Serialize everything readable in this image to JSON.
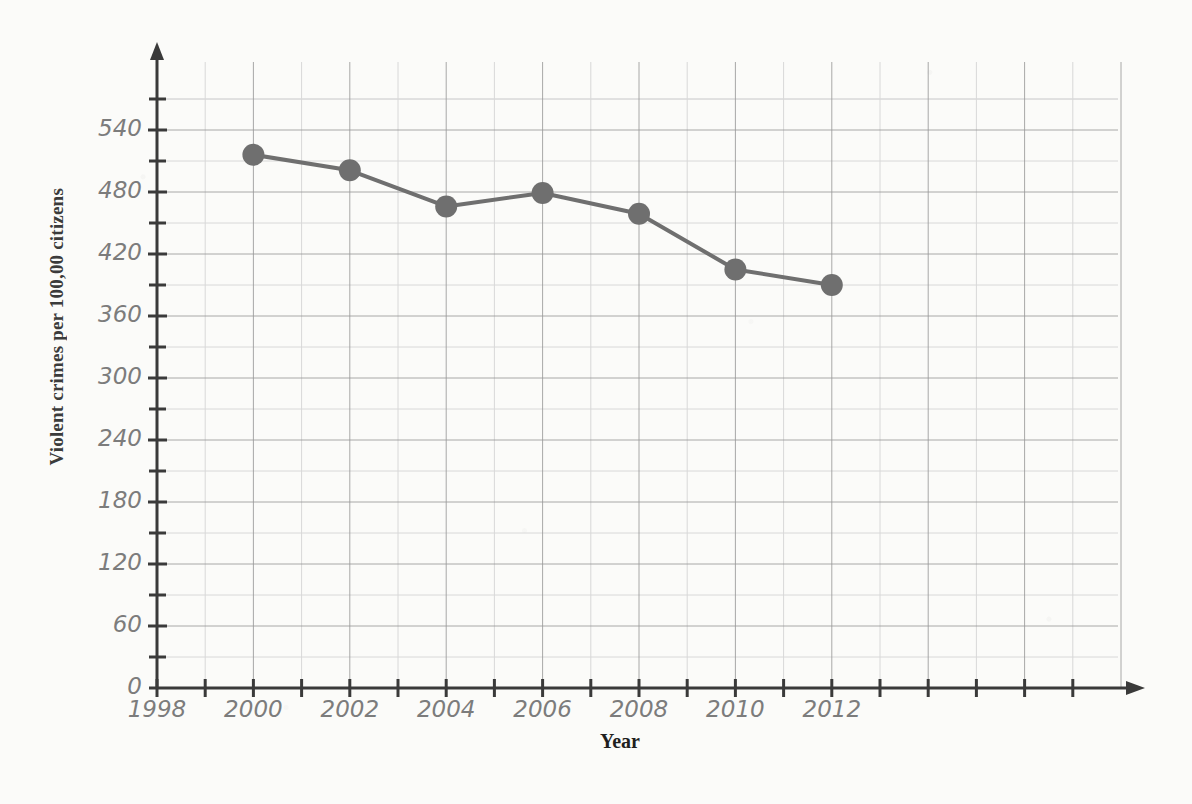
{
  "chart_data": {
    "type": "line",
    "title": "",
    "xlabel": "Year",
    "ylabel": "Violent crimes per 100,00 citizens",
    "x": [
      2000,
      2002,
      2004,
      2006,
      2008,
      2010,
      2012
    ],
    "values": [
      516,
      501,
      466,
      479,
      459,
      405,
      390
    ],
    "series": [
      {
        "name": "Violent crimes per 100,00 citizens",
        "x": [
          2000,
          2002,
          2004,
          2006,
          2008,
          2010,
          2012
        ],
        "values": [
          516,
          501,
          466,
          479,
          459,
          405,
          390
        ]
      }
    ],
    "xlim": [
      1998,
      2018
    ],
    "ylim": [
      0,
      570
    ],
    "x_major_ticks": [
      1998,
      2000,
      2002,
      2004,
      2006,
      2008,
      2010,
      2012,
      2014,
      2016,
      2018
    ],
    "x_tick_labels": [
      "1998",
      "2000",
      "2002",
      "2004",
      "2006",
      "2008",
      "2010",
      "2012",
      "",
      "",
      ""
    ],
    "x_minor_step": 1,
    "y_major_ticks": [
      0,
      60,
      120,
      180,
      240,
      300,
      360,
      420,
      480,
      540
    ],
    "y_tick_labels": [
      "0",
      "60",
      "120",
      "180",
      "240",
      "300",
      "360",
      "420",
      "480",
      "540"
    ],
    "y_minor_step": 30,
    "grid": true,
    "grid_major": true,
    "grid_minor": true,
    "legend": "none",
    "marker": "circle",
    "marker_size": 11,
    "line_color": "#6f6f6f",
    "marker_color": "#6f6f6f",
    "axis_color": "#3a3a3a",
    "grid_major_color": "#9a9a9a",
    "grid_minor_color": "#d8d8d8",
    "tick_label_color": "#7c7c7c",
    "background_color": "#fbfbf9",
    "annotations": []
  },
  "axes": {
    "y_title": "Violent crimes per 100,00 citizens",
    "x_title": "Year"
  }
}
